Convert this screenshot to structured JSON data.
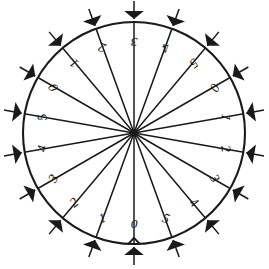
{
  "figure": {
    "name": "radial-dial-diagram",
    "background_color": "#ffffff",
    "ink_color": "#1a1a1a",
    "center_x": 134,
    "center_y": 133,
    "radius": 111,
    "spoke_count": 18,
    "arrow_count": 18,
    "label_sequence_note": "digits 0-5 repeated three times clockwise from bottom"
  },
  "chart_data": {
    "type": "scatter",
    "title": "",
    "subtitle": "",
    "xlabel": "",
    "ylabel": "",
    "grid": false,
    "legend": null,
    "coordinate_system": "polar",
    "angle_unit": "degrees",
    "angle_reference": "0 deg at bottom of circle, increasing clockwise",
    "categories": [
      "0",
      "1",
      "2",
      "3",
      "4",
      "5",
      "0",
      "1",
      "2",
      "3",
      "4",
      "5",
      "0",
      "1",
      "2",
      "3",
      "4",
      "5"
    ],
    "values": [
      111,
      111,
      111,
      111,
      111,
      111,
      111,
      111,
      111,
      111,
      111,
      111,
      111,
      111,
      111,
      111,
      111,
      111
    ],
    "spokes": [
      {
        "label": "0",
        "angle_deg": 0,
        "label_rotation_deg": 0,
        "label_radius": 92
      },
      {
        "label": "1",
        "angle_deg": 20,
        "label_rotation_deg": 20,
        "label_radius": 92
      },
      {
        "label": "2",
        "angle_deg": 40,
        "label_rotation_deg": 40,
        "label_radius": 92
      },
      {
        "label": "3",
        "angle_deg": 60,
        "label_rotation_deg": 60,
        "label_radius": 92
      },
      {
        "label": "4",
        "angle_deg": 80,
        "label_rotation_deg": 80,
        "label_radius": 92
      },
      {
        "label": "5",
        "angle_deg": 100,
        "label_rotation_deg": 100,
        "label_radius": 92
      },
      {
        "label": "0",
        "angle_deg": 120,
        "label_rotation_deg": 120,
        "label_radius": 92
      },
      {
        "label": "1",
        "angle_deg": 140,
        "label_rotation_deg": 140,
        "label_radius": 92
      },
      {
        "label": "2",
        "angle_deg": 160,
        "label_rotation_deg": 160,
        "label_radius": 92
      },
      {
        "label": "3",
        "angle_deg": 180,
        "label_rotation_deg": 180,
        "label_radius": 92
      },
      {
        "label": "4",
        "angle_deg": 200,
        "label_rotation_deg": 200,
        "label_radius": 92
      },
      {
        "label": "5",
        "angle_deg": 220,
        "label_rotation_deg": 220,
        "label_radius": 92
      },
      {
        "label": "0",
        "angle_deg": 240,
        "label_rotation_deg": 240,
        "label_radius": 92
      },
      {
        "label": "1",
        "angle_deg": 260,
        "label_rotation_deg": 260,
        "label_radius": 92
      },
      {
        "label": "2",
        "angle_deg": 280,
        "label_rotation_deg": 280,
        "label_radius": 92
      },
      {
        "label": "3",
        "angle_deg": 300,
        "label_rotation_deg": 300,
        "label_radius": 92
      },
      {
        "label": "4",
        "angle_deg": 320,
        "label_rotation_deg": 320,
        "label_radius": 92
      },
      {
        "label": "5",
        "angle_deg": 340,
        "label_rotation_deg": 340,
        "label_radius": 92
      }
    ],
    "arrows": [
      {
        "angle_deg": 0,
        "direction": "inward"
      },
      {
        "angle_deg": 20,
        "direction": "inward"
      },
      {
        "angle_deg": 40,
        "direction": "inward"
      },
      {
        "angle_deg": 60,
        "direction": "inward"
      },
      {
        "angle_deg": 80,
        "direction": "inward"
      },
      {
        "angle_deg": 100,
        "direction": "inward"
      },
      {
        "angle_deg": 120,
        "direction": "inward"
      },
      {
        "angle_deg": 140,
        "direction": "inward"
      },
      {
        "angle_deg": 160,
        "direction": "inward"
      },
      {
        "angle_deg": 180,
        "direction": "inward"
      },
      {
        "angle_deg": 200,
        "direction": "inward"
      },
      {
        "angle_deg": 220,
        "direction": "inward"
      },
      {
        "angle_deg": 240,
        "direction": "inward"
      },
      {
        "angle_deg": 260,
        "direction": "inward"
      },
      {
        "angle_deg": 280,
        "direction": "inward"
      },
      {
        "angle_deg": 300,
        "direction": "inward"
      },
      {
        "angle_deg": 320,
        "direction": "inward"
      },
      {
        "angle_deg": 340,
        "direction": "inward"
      }
    ]
  }
}
